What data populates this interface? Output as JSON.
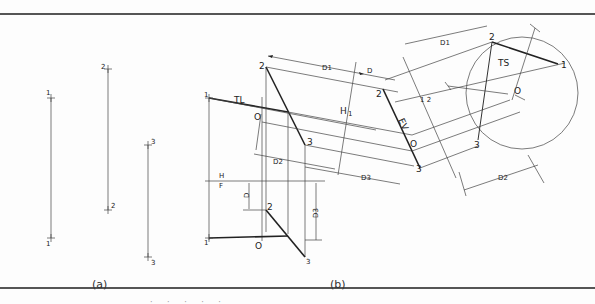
{
  "figure": {
    "panel_a": {
      "caption": "(a)",
      "points": [
        {
          "label": "1",
          "top_label": "1",
          "bottom_label": "1"
        },
        {
          "label": "2",
          "top_label": "2",
          "bottom_label": "2"
        },
        {
          "label": "3",
          "top_label": "3",
          "bottom_label": "3"
        }
      ]
    },
    "panel_b": {
      "caption": "(b)",
      "labels": {
        "p1_top": "1",
        "p2_top": "2",
        "p3_top": "3",
        "o_top": "O",
        "tl": "TL",
        "p1_bot": "1",
        "p2_bot": "2",
        "p3_bot": "3",
        "o_bot": "O",
        "h": "H",
        "f": "F",
        "d": "D",
        "d1": "D1",
        "d2": "D2",
        "d3": "D3",
        "d_aux": "D",
        "h1": "H",
        "h1_sub": "1",
        "ev": "EV",
        "aux_2": "2",
        "aux_o": "O",
        "aux_3": "3",
        "ref_1_2": "1 2",
        "ts_d1": "D1",
        "ts_2": "2",
        "ts_1": "1",
        "ts_3": "3",
        "ts_o": "O",
        "ts": "TS",
        "ts_d2": "D2"
      }
    },
    "footer_partial": "· · · · ·"
  }
}
